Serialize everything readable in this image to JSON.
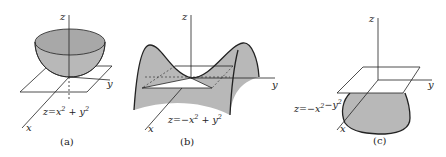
{
  "figure": {
    "panels": [
      {
        "id": "a",
        "caption": "(a)",
        "surface": "paraboloid opening upward",
        "equation": {
          "prefix": "z=",
          "t1": "x",
          "op": "+",
          "t2": "y",
          "exp": "2"
        },
        "axes": {
          "x": "x",
          "y": "y",
          "z": "z"
        }
      },
      {
        "id": "b",
        "caption": "(b)",
        "surface": "hyperbolic paraboloid (saddle)",
        "equation": {
          "prefix": "z=−",
          "t1": "x",
          "op": "+",
          "t2": "y",
          "exp": "2"
        },
        "axes": {
          "x": "x",
          "y": "y",
          "z": "z"
        }
      },
      {
        "id": "c",
        "caption": "(c)",
        "surface": "paraboloid opening downward",
        "equation": {
          "prefix": "z=−",
          "t1": "x",
          "op": "−",
          "t2": "y",
          "exp": "2"
        },
        "axes": {
          "x": "x",
          "y": "y",
          "z": "z"
        }
      }
    ],
    "colors": {
      "fill": "#b8b8b8",
      "line": "#222222",
      "background": "#ffffff"
    }
  }
}
